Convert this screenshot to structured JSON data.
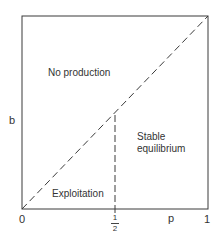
{
  "diagram": {
    "regions": {
      "no_production": "No production",
      "stable_line1": "Stable",
      "stable_line2": "equilibrium",
      "exploitation": "Exploitation"
    },
    "axes": {
      "y_label": "b",
      "x_label": "p",
      "x_origin": "0",
      "x_end": "1",
      "x_half_num": "1",
      "x_half_den": "2"
    },
    "lines": {
      "diagonal": "b = p (dashed)",
      "vertical": "p = 1/2 (dashed)"
    },
    "colors": {
      "stroke": "#3a3a3a",
      "background": "#ffffff"
    }
  }
}
